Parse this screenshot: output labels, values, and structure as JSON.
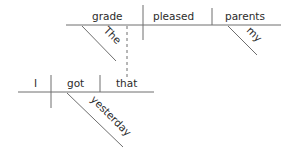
{
  "diagram": {
    "type": "reed-kellogg sentence diagram",
    "main_clause": {
      "subject": "grade",
      "verb": "pleased",
      "direct_object": "parents",
      "modifiers": {
        "subject": [
          "The"
        ],
        "direct_object": [
          "my"
        ]
      }
    },
    "relative_clause": {
      "subject": "I",
      "verb": "got",
      "direct_object": "that",
      "modifiers": {
        "verb": [
          "yesterday"
        ]
      },
      "connects_to": "grade"
    },
    "colors": {
      "line": "#6e6e6e",
      "text": "#2b2b2b",
      "background": "#ffffff"
    }
  }
}
